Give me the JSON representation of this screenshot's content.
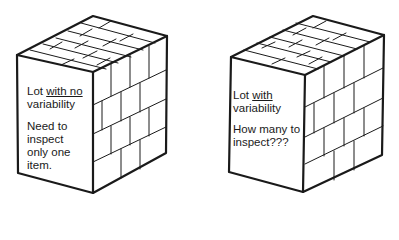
{
  "diagram": {
    "left_box": {
      "title_prefix": "Lot ",
      "title_underlined": "with no",
      "title_line2": "variability",
      "note_lines": [
        "Need to",
        "inspect",
        "only one",
        "item."
      ]
    },
    "right_box": {
      "title_prefix": "Lot ",
      "title_underlined": "with",
      "title_line2": "variability",
      "note_lines": [
        "How many to",
        "inspect???"
      ]
    }
  }
}
